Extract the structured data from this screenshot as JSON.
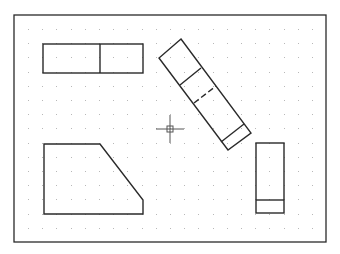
{
  "drawing": {
    "background": "#ffffff",
    "stroke_color": "#2a2a2a",
    "grid_color": "#b8b8b8",
    "frame": {
      "x1": 14,
      "y1": 15,
      "x2": 326,
      "y2": 242
    },
    "grid": {
      "start_x": 28,
      "start_y": 29,
      "spacing": 14.2,
      "end_x": 320,
      "end_y": 240
    },
    "shapes": [
      {
        "name": "split-rectangle",
        "type": "rect",
        "x": 43,
        "y": 44,
        "w": 100,
        "h": 29,
        "divider_x": 100
      },
      {
        "name": "rotated-bar",
        "type": "polygon",
        "points": "181,39 251,133 228,150 159,58",
        "inner_lines": [
          {
            "x1": 180,
            "y1": 85,
            "x2": 201,
            "y2": 68,
            "style": "solid"
          },
          {
            "x1": 194,
            "y1": 103,
            "x2": 216,
            "y2": 86,
            "style": "dashed"
          },
          {
            "x1": 221,
            "y1": 142,
            "x2": 244,
            "y2": 124,
            "style": "solid"
          }
        ]
      },
      {
        "name": "chamfered-block",
        "type": "polygon",
        "points": "44,144 100,144 143,200 143,214 44,214"
      },
      {
        "name": "small-split-rectangle",
        "type": "rect",
        "x": 256,
        "y": 143,
        "w": 28,
        "h": 70,
        "divider_y": 200
      }
    ],
    "cursor": {
      "x": 170,
      "y": 129,
      "arm": 14,
      "box": 3
    }
  }
}
